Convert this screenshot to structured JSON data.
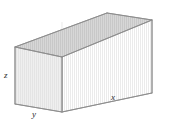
{
  "figure": {
    "shape_name": "rectangular-box",
    "projection": "oblique-3d",
    "background_color": "#ffffff",
    "stroke_color": "#8d8d8d",
    "hidden_stroke_color": "#bdbdbd",
    "face_colors": {
      "top": "#cfcfcf",
      "front_long": "#e9e9e9",
      "front_short": "#f2f2f2",
      "interior": "#f5f5f5"
    },
    "label_color": "#2b2b2b"
  },
  "labels": {
    "z": "z",
    "y": "y",
    "x": "x"
  },
  "geometry": {
    "note": "vertices in screenshot pixel coordinates",
    "vertices": {
      "front_bottom_left": [
        15,
        104
      ],
      "front_top_left": [
        15,
        47
      ],
      "front_bottom_right": [
        62,
        112
      ],
      "front_top_right": [
        62,
        57
      ],
      "back_bottom_left": [
        107,
        87
      ],
      "back_top_left": [
        107,
        20
      ],
      "back_bottom_right": [
        152,
        93
      ],
      "back_top_right": [
        152,
        20
      ]
    },
    "edges": {
      "z_edge": "front_bottom_left -> front_top_left",
      "y_edge": "front_bottom_left -> front_bottom_right",
      "x_edge": "front_bottom_right -> back_bottom_right"
    }
  }
}
